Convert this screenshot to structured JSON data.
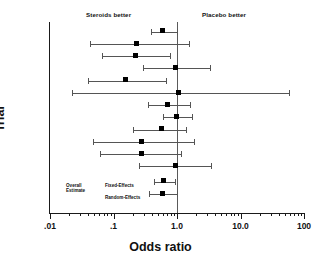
{
  "chart_data": {
    "type": "scatter",
    "subtype": "forest-plot",
    "title": "",
    "xlabel": "Odds ratio",
    "ylabel": "Trial",
    "xscale": "log10",
    "xlim": [
      0.01,
      100
    ],
    "xticks": [
      0.01,
      0.1,
      1.0,
      10.0,
      100
    ],
    "xticklabels": [
      ".01",
      ".1",
      "1.0",
      "10.0",
      "100"
    ],
    "grid": false,
    "legend": "none",
    "reference_line": 1.0,
    "annotations": [
      {
        "text": "Steroids better",
        "side": "left"
      },
      {
        "text": "Placebo better",
        "side": "right"
      }
    ],
    "overall_label": "Overall\nEstimate",
    "series": [
      {
        "name": "Trial 1",
        "or": 0.6,
        "low": 0.39,
        "high": 1.0
      },
      {
        "name": "Trial 2",
        "or": 0.23,
        "low": 0.042,
        "high": 1.55
      },
      {
        "name": "Trial 3",
        "or": 0.22,
        "low": 0.065,
        "high": 0.78
      },
      {
        "name": "Trial 4",
        "or": 0.95,
        "low": 0.29,
        "high": 3.25
      },
      {
        "name": "Trial 5",
        "or": 0.155,
        "low": 0.039,
        "high": 0.67
      },
      {
        "name": "Trial 6",
        "or": 1.05,
        "low": 0.022,
        "high": 58.0
      },
      {
        "name": "Trial 7",
        "or": 0.72,
        "low": 0.35,
        "high": 1.6
      },
      {
        "name": "Trial 8",
        "or": 0.97,
        "low": 0.6,
        "high": 1.7
      },
      {
        "name": "Trial 9",
        "or": 0.56,
        "low": 0.2,
        "high": 1.4
      },
      {
        "name": "Trial 10",
        "or": 0.28,
        "low": 0.048,
        "high": 1.85
      },
      {
        "name": "Trial 11",
        "or": 0.28,
        "low": 0.062,
        "high": 1.15
      },
      {
        "name": "Trial 12",
        "or": 0.95,
        "low": 0.25,
        "high": 3.4
      },
      {
        "name": "Fixed-Effects",
        "or": 0.62,
        "low": 0.44,
        "high": 0.93,
        "overall": true
      },
      {
        "name": "Random-Effects",
        "or": 0.6,
        "low": 0.36,
        "high": 0.99,
        "overall": true
      }
    ]
  },
  "labels": {
    "steroids_better": "Steroids better",
    "placebo_better": "Placebo better",
    "x_title": "Odds ratio",
    "y_title": "Trial",
    "overall_line1": "Overall",
    "overall_line2": "Estimate",
    "fixed_effects": "Fixed-Effects",
    "random_effects": "Random-Effects"
  },
  "colors": {
    "axis": "#1a1a1a",
    "marker": "#000000",
    "ci": "#555555",
    "refline": "#5a5a5a",
    "background": "#ffffff"
  }
}
